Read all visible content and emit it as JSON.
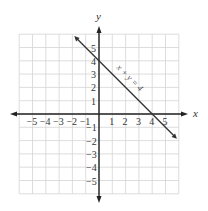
{
  "chart_data": {
    "type": "line",
    "title": "",
    "xlabel": "x",
    "ylabel": "y",
    "xlim": [
      -6,
      6
    ],
    "ylim": [
      -6,
      6
    ],
    "grid": true,
    "x_ticks": [
      "-5",
      "-4",
      "-3",
      "-2",
      "-1",
      "1",
      "2",
      "3",
      "4",
      "5"
    ],
    "y_ticks": [
      "5",
      "4",
      "3",
      "2",
      "1",
      "-1",
      "-2",
      "-3",
      "-4",
      "-5"
    ],
    "series": [
      {
        "name": "x + y = 4",
        "equation": "x + y = 4",
        "x": [
          -2,
          6
        ],
        "y": [
          6,
          -2
        ],
        "intercepts": {
          "x": 4,
          "y": 4
        }
      }
    ],
    "annotations": [
      {
        "text": "x + y = 4",
        "near": [
          2.3,
          2.2
        ],
        "rotation": 45
      }
    ]
  },
  "labels": {
    "x_axis": "x",
    "y_axis": "y",
    "equation": "x + y = 4"
  }
}
